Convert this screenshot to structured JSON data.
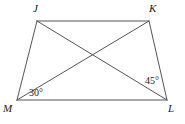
{
  "figure": {
    "kind": "quadrilateral-with-diagonals",
    "name": "Quadrilateral JKLM with diagonals JL and KM",
    "stroke_color": "#555555",
    "background_color": "#ffffff",
    "text_color": "#1a1a1a",
    "stroke_width": 1
  },
  "vertices": [
    {
      "id": "J",
      "label": "J",
      "x": 37,
      "y": 21
    },
    {
      "id": "K",
      "label": "K",
      "x": 149,
      "y": 21
    },
    {
      "id": "L",
      "label": "L",
      "x": 167,
      "y": 100
    },
    {
      "id": "M",
      "label": "M",
      "x": 17,
      "y": 100
    }
  ],
  "sides": [
    {
      "id": "JK",
      "from": "J",
      "to": "K"
    },
    {
      "id": "KL",
      "from": "K",
      "to": "L"
    },
    {
      "id": "LM",
      "from": "L",
      "to": "M"
    },
    {
      "id": "MJ",
      "from": "M",
      "to": "J"
    }
  ],
  "diagonals": [
    {
      "id": "JL",
      "from": "J",
      "to": "L"
    },
    {
      "id": "KM",
      "from": "K",
      "to": "M"
    }
  ],
  "intersection": {
    "id": "P",
    "x": 93,
    "y": 55
  },
  "angles": [
    {
      "id": "angle-M",
      "label": "30°",
      "value": 30,
      "unit": "degrees",
      "at_vertex": "M",
      "between": [
        "ML",
        "MK"
      ]
    },
    {
      "id": "angle-L",
      "label": "45°",
      "value": 45,
      "unit": "degrees",
      "at_vertex": "L",
      "between": [
        "LJ",
        "LM"
      ]
    }
  ]
}
